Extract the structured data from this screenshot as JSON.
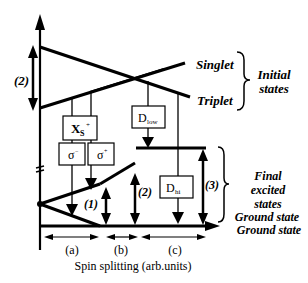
{
  "diagram": {
    "type": "energy-level diagram",
    "labels": {
      "singlet": "Singlet",
      "triplet": "Triplet",
      "initial_states_line1": "Initial",
      "initial_states_line2": "states",
      "final_line1": "Final",
      "final_line2": "excited",
      "final_line3": "states",
      "ground_state_1": "Ground state",
      "ground_state_2": "Ground state",
      "x_axis_label": "Spin splitting (arb.units)"
    },
    "boxes": {
      "xs": {
        "main": "X",
        "sub": "S",
        "sup": "+"
      },
      "sigma_minus": {
        "main": "σ",
        "sup": "−"
      },
      "sigma_plus": {
        "main": "σ",
        "sup": "+"
      },
      "d_low": {
        "main": "D",
        "sub": "low"
      },
      "d_hi": {
        "main": "D",
        "sub": "hi"
      }
    },
    "arrow_labels": {
      "left_2": "(2)",
      "a1": "(1)",
      "b2": "(2)",
      "c3": "(3)"
    },
    "regions": [
      "(a)",
      "(b)",
      "(c)"
    ]
  }
}
